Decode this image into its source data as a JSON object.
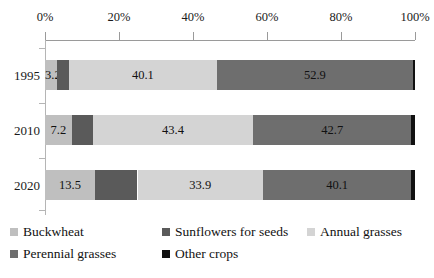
{
  "chart_data": {
    "type": "bar",
    "orientation": "horizontal",
    "stacked": true,
    "normalized_percent": true,
    "title": "",
    "subtitle": "",
    "xlabel": "",
    "ylabel": "",
    "xlim": [
      0,
      100
    ],
    "grid": false,
    "axis_position": "top",
    "legend_position": "bottom",
    "categories": [
      "1995",
      "2010",
      "2020"
    ],
    "xtick_labels": [
      "0%",
      "20%",
      "40%",
      "60%",
      "80%",
      "100%"
    ],
    "xtick_values": [
      0,
      20,
      40,
      60,
      80,
      100
    ],
    "series": [
      {
        "name": "Buckwheat",
        "color": "#bfbfbf",
        "values": [
          3.2,
          7.2,
          13.5
        ],
        "data_labels": [
          "3.2",
          "7.2",
          "13.5"
        ],
        "show_labels": true
      },
      {
        "name": "Sunflowers for seeds",
        "color": "#5a5a5a",
        "values": [
          3.2,
          5.7,
          11.5
        ],
        "data_labels": [
          "",
          "",
          ""
        ],
        "show_labels": false
      },
      {
        "name": "Annual grasses",
        "color": "#d4d4d4",
        "values": [
          40.1,
          43.4,
          33.9
        ],
        "data_labels": [
          "40.1",
          "43.4",
          "33.9"
        ],
        "show_labels": true
      },
      {
        "name": "Perennial grasses",
        "color": "#6e6e6e",
        "values": [
          52.9,
          42.7,
          40.1
        ],
        "data_labels": [
          "52.9",
          "42.7",
          "40.1"
        ],
        "show_labels": true
      },
      {
        "name": "Other crops",
        "color": "#111111",
        "values": [
          0.6,
          1.0,
          1.0
        ],
        "data_labels": [
          "",
          "",
          ""
        ],
        "show_labels": false
      }
    ]
  },
  "legend": {
    "items": [
      {
        "label": "Buckwheat",
        "color": "#bfbfbf"
      },
      {
        "label": "Sunflowers for seeds",
        "color": "#5a5a5a"
      },
      {
        "label": "Annual grasses",
        "color": "#d4d4d4"
      },
      {
        "label": "Perennial grasses",
        "color": "#6e6e6e"
      },
      {
        "label": "Other crops",
        "color": "#111111"
      }
    ]
  },
  "axis": {
    "line_color": "#9a9a9a"
  }
}
